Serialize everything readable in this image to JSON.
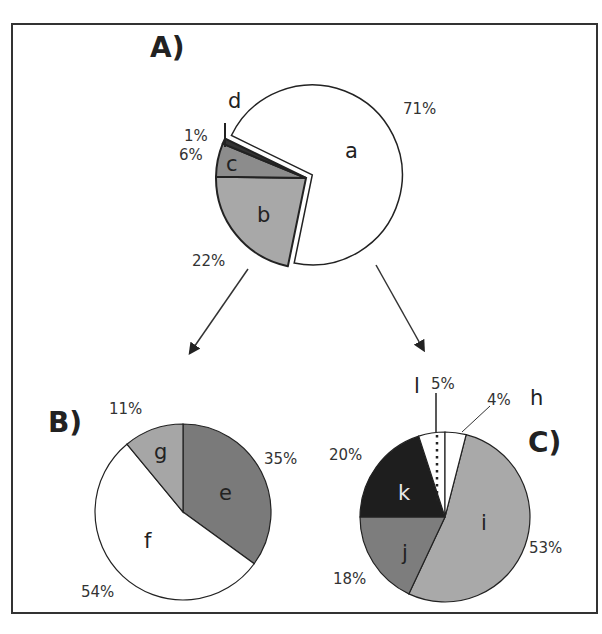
{
  "chart_data": [
    {
      "panel": "A)",
      "type": "pie",
      "slices": [
        {
          "label": "a",
          "value": 71,
          "pct_label": "71%",
          "color": "#ffffff",
          "exploded": true
        },
        {
          "label": "b",
          "value": 22,
          "pct_label": "22%",
          "color": "#a8a8a8"
        },
        {
          "label": "c",
          "value": 6,
          "pct_label": "6%",
          "color": "#8c8c8c"
        },
        {
          "label": "d",
          "value": 1,
          "pct_label": "1%",
          "color": "#333333"
        }
      ]
    },
    {
      "panel": "B)",
      "type": "pie",
      "slices": [
        {
          "label": "e",
          "value": 35,
          "pct_label": "35%",
          "color": "#7a7a7a"
        },
        {
          "label": "f",
          "value": 54,
          "pct_label": "54%",
          "color": "#ffffff"
        },
        {
          "label": "g",
          "value": 11,
          "pct_label": "11%",
          "color": "#a6a6a6"
        }
      ]
    },
    {
      "panel": "C)",
      "type": "pie",
      "slices": [
        {
          "label": "i",
          "value": 53,
          "pct_label": "53%",
          "color": "#a9a9a9"
        },
        {
          "label": "j",
          "value": 18,
          "pct_label": "18%",
          "color": "#7d7d7d"
        },
        {
          "label": "k",
          "value": 20,
          "pct_label": "20%",
          "color": "#1e1e1e"
        },
        {
          "label": "l",
          "value": 5,
          "pct_label": "5%",
          "color": "#ffffff",
          "pattern": "dotted"
        },
        {
          "label": "h",
          "value": 4,
          "pct_label": "4%",
          "color": "#ffffff"
        }
      ]
    }
  ],
  "annotations": {
    "arrows": [
      "A→B",
      "A→C"
    ]
  }
}
